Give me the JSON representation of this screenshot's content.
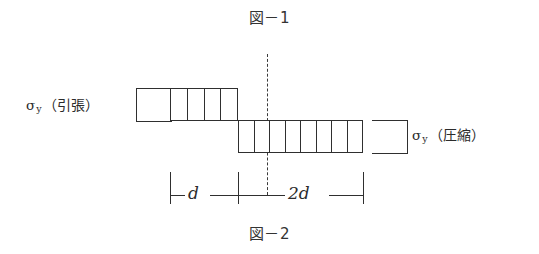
{
  "figure": {
    "caption_top": "図－1",
    "caption_bottom": "図－2",
    "background_color": "#ffffff",
    "line_color": "#2f2f2f",
    "centerline_style": "dashed"
  },
  "labels": {
    "tension": {
      "symbol": "σ",
      "subscript": "y",
      "qualifier": "（引張）",
      "full": "σy（引張）"
    },
    "compression": {
      "symbol": "σ",
      "subscript": "y",
      "qualifier": "（圧縮）",
      "full": "σy（圧縮）"
    }
  },
  "blocks": {
    "tension": {
      "name": "tensile-stress-block",
      "cells": 4,
      "width_label": "d",
      "position": "above-neutral-axis"
    },
    "compression": {
      "name": "compressive-stress-block",
      "cells": 8,
      "width_label": "2d",
      "position": "below-neutral-axis"
    }
  },
  "dimensions": [
    {
      "label": "d",
      "span": "tension-block-width"
    },
    {
      "label": "2d",
      "span": "compression-block-width"
    }
  ]
}
